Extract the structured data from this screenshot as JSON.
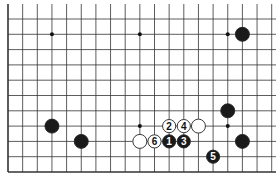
{
  "diagram": {
    "type": "go-board-fragment",
    "grid": {
      "origin_x": 8,
      "origin_y": 19,
      "dx": 14.65,
      "dy": 15.3,
      "cols": 19,
      "rows": 11,
      "left_edge": true,
      "bottom_edge": true,
      "top_edge": false,
      "right_edge": false,
      "line_color": "#333333"
    },
    "star_points": [
      {
        "col": 3,
        "row": 1
      },
      {
        "col": 9,
        "row": 1
      },
      {
        "col": 15,
        "row": 1
      },
      {
        "col": 9,
        "row": 7
      },
      {
        "col": 15,
        "row": 7
      }
    ],
    "stones": [
      {
        "color": "black",
        "col": 16,
        "row": 1,
        "label": ""
      },
      {
        "color": "black",
        "col": 3,
        "row": 7,
        "label": ""
      },
      {
        "color": "black",
        "col": 5,
        "row": 8,
        "label": ""
      },
      {
        "color": "black",
        "col": 15,
        "row": 6,
        "label": ""
      },
      {
        "color": "black",
        "col": 16,
        "row": 8,
        "label": ""
      },
      {
        "color": "white",
        "col": 13,
        "row": 7,
        "label": ""
      },
      {
        "color": "white",
        "col": 9,
        "row": 8,
        "label": ""
      },
      {
        "color": "black",
        "col": 11,
        "row": 8,
        "label": "1"
      },
      {
        "color": "white",
        "col": 11,
        "row": 7,
        "label": "2"
      },
      {
        "color": "black",
        "col": 12,
        "row": 8,
        "label": "3"
      },
      {
        "color": "white",
        "col": 12,
        "row": 7,
        "label": "4"
      },
      {
        "color": "black",
        "col": 14,
        "row": 9,
        "label": "5"
      },
      {
        "color": "white",
        "col": 10,
        "row": 8,
        "label": "6"
      }
    ],
    "colors": {
      "black_stone": "#1a1a1a",
      "white_stone": "#ffffff",
      "stone_outline": "#222222"
    }
  }
}
